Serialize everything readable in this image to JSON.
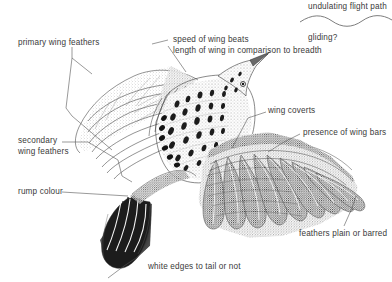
{
  "figure": {
    "kind": "annotated-bird-flight-diagram",
    "style": "pen-and-ink stipple line drawing",
    "background_color": "#ffffff",
    "ink_color": "#2e2e2e",
    "leader_line_color": "#555555",
    "text_color": "#3a3a3a"
  },
  "annotations": {
    "primary_wing_feathers": "primary wing feathers",
    "secondary_wing_feathers_line1": "secondary",
    "secondary_wing_feathers_line2": "wing feathers",
    "rump_colour": "rump colour",
    "speed_of_wing_beats": "speed of wing beats",
    "length_of_wing": "length of wing in comparison to breadth",
    "wing_coverts": "wing coverts",
    "presence_of_wing_bars": "presence of wing bars",
    "feathers_plain_or_barred": "feathers plain or barred",
    "white_edges_to_tail": "white edges to tail or not",
    "undulating_flight_path": "undulating flight path",
    "gliding": "gliding?"
  },
  "flight_path": {
    "shape": "sine-wave",
    "description": "undulating wavy line sketch"
  }
}
